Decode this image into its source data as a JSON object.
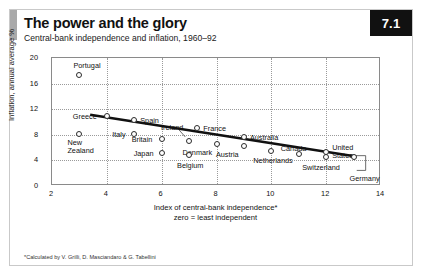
{
  "header": {
    "title": "The power and the glory",
    "subtitle": "Central-bank independence and inflation, 1960–92",
    "badge": "7.1"
  },
  "footnote": "*Calculated by V. Grilli, D. Masciandaro & G. Tabellini",
  "chart_data": {
    "type": "scatter",
    "title": "The power and the glory",
    "subtitle": "Central-bank independence and inflation, 1960–92",
    "xlabel": "Index of central-bank independence*",
    "xlabel_note": "zero = least independent",
    "ylabel": "Inflation, annual average %",
    "xlim": [
      2,
      14
    ],
    "ylim": [
      0,
      20
    ],
    "xticks": [
      2,
      4,
      6,
      8,
      10,
      12,
      14
    ],
    "yticks": [
      0,
      4,
      8,
      12,
      16,
      20
    ],
    "grid": true,
    "legend": "none",
    "trendline": {
      "x1": 3.4,
      "y1": 11.0,
      "x2": 13.1,
      "y2": 4.4
    },
    "points": [
      {
        "name": "Portugal",
        "x": 3.0,
        "y": 17.4,
        "lx": -6,
        "ly": -13,
        "align": "left"
      },
      {
        "name": "Greece",
        "x": 4.0,
        "y": 11.0,
        "lx": -34,
        "ly": -3,
        "align": "left"
      },
      {
        "name": "New Zealand",
        "x": 3.0,
        "y": 8.1,
        "lx": -12,
        "ly": 5,
        "align": "left",
        "lines": [
          "New",
          "Zealand"
        ]
      },
      {
        "name": "Spain",
        "x": 5.0,
        "y": 10.3,
        "lx": 6,
        "ly": -3,
        "align": "left"
      },
      {
        "name": "Italy",
        "x": 5.0,
        "y": 8.2,
        "lx": -22,
        "ly": -3,
        "align": "left"
      },
      {
        "name": "Britain",
        "x": 6.0,
        "y": 7.3,
        "lx": -30,
        "ly": -3,
        "align": "left"
      },
      {
        "name": "Japan",
        "x": 6.0,
        "y": 5.2,
        "lx": -28,
        "ly": -3,
        "align": "left"
      },
      {
        "name": "Ireland",
        "x": 7.0,
        "y": 7.0,
        "lx": -28,
        "ly": -17,
        "align": "left",
        "leader": {
          "x1": -10,
          "y1": -11,
          "x2": -3,
          "y2": -3
        }
      },
      {
        "name": "France",
        "x": 7.3,
        "y": 9.1,
        "lx": 6,
        "ly": -3,
        "align": "left"
      },
      {
        "name": "Denmark",
        "x": 8.0,
        "y": 6.5,
        "lx": -34,
        "ly": 5,
        "align": "left"
      },
      {
        "name": "Belgium",
        "x": 7.0,
        "y": 4.8,
        "lx": -12,
        "ly": 7,
        "align": "left"
      },
      {
        "name": "Austria",
        "x": 9.0,
        "y": 6.2,
        "lx": -28,
        "ly": 5,
        "align": "left"
      },
      {
        "name": "Australia",
        "x": 9.0,
        "y": 7.6,
        "lx": 6,
        "ly": -3,
        "align": "left"
      },
      {
        "name": "Netherlands",
        "x": 10.0,
        "y": 5.5,
        "lx": -18,
        "ly": 6,
        "align": "left"
      },
      {
        "name": "Canada",
        "x": 11.0,
        "y": 5.0,
        "lx": -18,
        "ly": -9,
        "align": "left"
      },
      {
        "name": "Switzerland",
        "x": 12.0,
        "y": 4.6,
        "lx": -24,
        "ly": 7,
        "align": "left"
      },
      {
        "name": "United States",
        "x": 12.0,
        "y": 5.3,
        "lx": 6,
        "ly": -8,
        "align": "left",
        "lines": [
          "United",
          "States"
        ]
      },
      {
        "name": "Germany",
        "x": 13.0,
        "y": 4.5,
        "lx": -4,
        "ly": 18,
        "align": "left",
        "leader": {
          "x1": 3,
          "y1": 0,
          "x2": 14,
          "y2": 15,
          "elbow": true
        }
      }
    ]
  }
}
